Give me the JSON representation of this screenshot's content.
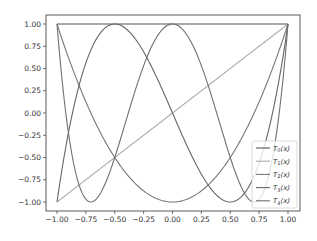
{
  "chart_data": {
    "type": "line",
    "title": "",
    "xlabel": "",
    "ylabel": "",
    "xlim": [
      -1.1,
      1.1
    ],
    "ylim": [
      -1.1,
      1.1
    ],
    "grid": false,
    "legend_position": "lower right",
    "x_ticks": [
      "-1.00",
      "-0.75",
      "-0.50",
      "-0.25",
      "0.00",
      "0.25",
      "0.50",
      "0.75",
      "1.00"
    ],
    "y_ticks": [
      "1.00",
      "0.75",
      "0.50",
      "0.25",
      "0.00",
      "-0.25",
      "-0.50",
      "-0.75",
      "-1.00"
    ],
    "series": [
      {
        "name": "T0(x)",
        "label_base": "T",
        "label_sub": "0",
        "label_arg": "(x)",
        "color": "#555555",
        "formula": "1"
      },
      {
        "name": "T1(x)",
        "label_base": "T",
        "label_sub": "1",
        "label_arg": "(x)",
        "color": "#aaaaaa",
        "formula": "x"
      },
      {
        "name": "T2(x)",
        "label_base": "T",
        "label_sub": "2",
        "label_arg": "(x)",
        "color": "#777777",
        "formula": "2x^2-1"
      },
      {
        "name": "T3(x)",
        "label_base": "T",
        "label_sub": "3",
        "label_arg": "(x)",
        "color": "#666666",
        "formula": "4x^3-3x"
      },
      {
        "name": "T4(x)",
        "label_base": "T",
        "label_sub": "4",
        "label_arg": "(x)",
        "color": "#707070",
        "formula": "8x^4-8x^2+1"
      }
    ]
  }
}
